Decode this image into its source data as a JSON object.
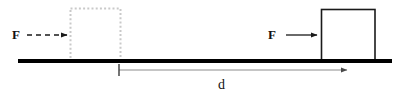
{
  "diagram": {
    "canvas": {
      "width": 400,
      "height": 94,
      "background": "#ffffff"
    },
    "colors": {
      "ground": "#000000",
      "box_outline": "#1a1a1a",
      "box_fill": "#ffffff",
      "ghost_outline": "#c9c9c9",
      "arrow_solid": "#1a1a1a",
      "arrow_dashed": "#1a1a1a",
      "dimension_line": "#8c8c8c",
      "text": "#111111"
    },
    "ground": {
      "name": "ground-line",
      "x1": 18,
      "y1": 61,
      "x2": 392,
      "y2": 61,
      "thickness": 4
    },
    "ghost_block": {
      "name": "initial-block-position",
      "label": "",
      "x": 70,
      "y": 8,
      "width": 50,
      "height": 53,
      "style": "dashed"
    },
    "solid_block": {
      "name": "final-block-position",
      "label": "",
      "x": 321,
      "y": 9,
      "width": 54,
      "height": 52,
      "style": "solid"
    },
    "forces": [
      {
        "id": "force-left",
        "label": "F",
        "label_x": 12,
        "label_y": 39,
        "arrow_x1": 27,
        "arrow_x2": 68,
        "arrow_y": 35,
        "style": "dashed",
        "direction": "right"
      },
      {
        "id": "force-right",
        "label": "F",
        "label_x": 268,
        "label_y": 39,
        "arrow_x1": 286,
        "arrow_x2": 318,
        "arrow_y": 35,
        "style": "solid",
        "direction": "right"
      }
    ],
    "dimension": {
      "id": "displacement-dimension",
      "label": "d",
      "label_x": 222,
      "label_y": 89,
      "x1": 119,
      "x2": 349,
      "y": 70,
      "tick_x": 119,
      "tick_top": 64,
      "tick_bottom": 76,
      "direction": "right"
    }
  }
}
